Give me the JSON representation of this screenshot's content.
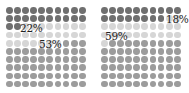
{
  "chart_data": [
    {
      "type": "waffle",
      "grid": [
        10,
        10
      ],
      "categories": [
        "dark",
        "light",
        "medium"
      ],
      "values": [
        22,
        25,
        53
      ],
      "colors": [
        "#6f6f6f",
        "#d6d6d6",
        "#9c9c9c"
      ],
      "labels": [
        {
          "text": "22%",
          "category": "dark"
        },
        {
          "text": "53%",
          "category": "medium"
        }
      ]
    },
    {
      "type": "waffle",
      "grid": [
        10,
        10
      ],
      "categories": [
        "dark",
        "light",
        "medium"
      ],
      "values": [
        18,
        23,
        59
      ],
      "colors": [
        "#6f6f6f",
        "#d6d6d6",
        "#9c9c9c"
      ],
      "labels": [
        {
          "text": "18%",
          "category": "dark"
        },
        {
          "text": "59%",
          "category": "medium"
        }
      ]
    }
  ],
  "charts": {
    "left": {
      "label_a": "22%",
      "label_b": "53%"
    },
    "right": {
      "label_a": "18%",
      "label_b": "59%"
    }
  }
}
